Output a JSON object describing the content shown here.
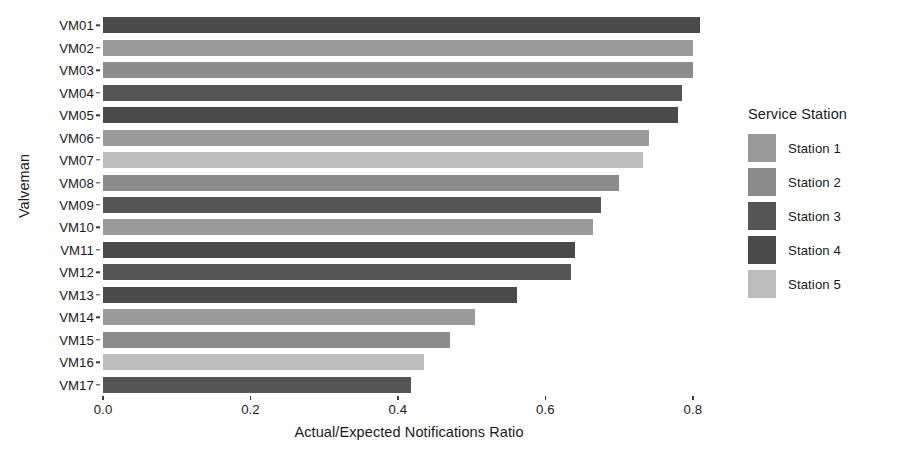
{
  "chart_data": {
    "type": "bar",
    "orientation": "horizontal",
    "title": "",
    "xlabel": "Actual/Expected Notifications Ratio",
    "ylabel": "Valveman",
    "xlim": [
      0.0,
      0.83
    ],
    "xticks": [
      0.0,
      0.2,
      0.4,
      0.6,
      0.8
    ],
    "xtick_labels": [
      "0.0",
      "0.2",
      "0.4",
      "0.6",
      "0.8"
    ],
    "grid": false,
    "legend_position": "right",
    "categories": [
      "VM01",
      "VM02",
      "VM03",
      "VM04",
      "VM05",
      "VM06",
      "VM07",
      "VM08",
      "VM09",
      "VM10",
      "VM11",
      "VM12",
      "VM13",
      "VM14",
      "VM15",
      "VM16",
      "VM17"
    ],
    "values": [
      0.81,
      0.8,
      0.8,
      0.785,
      0.78,
      0.74,
      0.733,
      0.7,
      0.675,
      0.665,
      0.64,
      0.635,
      0.562,
      0.505,
      0.47,
      0.435,
      0.418
    ],
    "group_of_bar": [
      "Station 4",
      "Station 1",
      "Station 2",
      "Station 3",
      "Station 4",
      "Station 1",
      "Station 5",
      "Station 2",
      "Station 3",
      "Station 1",
      "Station 4",
      "Station 3",
      "Station 4",
      "Station 1",
      "Station 2",
      "Station 5",
      "Station 3"
    ],
    "bars": [
      {
        "category": "VM01",
        "value": 0.81,
        "station": "Station 4",
        "color": "#4a4a4a"
      },
      {
        "category": "VM02",
        "value": 0.8,
        "station": "Station 1",
        "color": "#9a9a9a"
      },
      {
        "category": "VM03",
        "value": 0.8,
        "station": "Station 2",
        "color": "#8c8c8c"
      },
      {
        "category": "VM04",
        "value": 0.785,
        "station": "Station 3",
        "color": "#555555"
      },
      {
        "category": "VM05",
        "value": 0.78,
        "station": "Station 4",
        "color": "#4a4a4a"
      },
      {
        "category": "VM06",
        "value": 0.74,
        "station": "Station 1",
        "color": "#9a9a9a"
      },
      {
        "category": "VM07",
        "value": 0.733,
        "station": "Station 5",
        "color": "#bdbdbd"
      },
      {
        "category": "VM08",
        "value": 0.7,
        "station": "Station 2",
        "color": "#8c8c8c"
      },
      {
        "category": "VM09",
        "value": 0.675,
        "station": "Station 3",
        "color": "#555555"
      },
      {
        "category": "VM10",
        "value": 0.665,
        "station": "Station 1",
        "color": "#9a9a9a"
      },
      {
        "category": "VM11",
        "value": 0.64,
        "station": "Station 4",
        "color": "#4a4a4a"
      },
      {
        "category": "VM12",
        "value": 0.635,
        "station": "Station 3",
        "color": "#555555"
      },
      {
        "category": "VM13",
        "value": 0.562,
        "station": "Station 4",
        "color": "#4a4a4a"
      },
      {
        "category": "VM14",
        "value": 0.505,
        "station": "Station 1",
        "color": "#9a9a9a"
      },
      {
        "category": "VM15",
        "value": 0.47,
        "station": "Station 2",
        "color": "#8c8c8c"
      },
      {
        "category": "VM16",
        "value": 0.435,
        "station": "Station 5",
        "color": "#bdbdbd"
      },
      {
        "category": "VM17",
        "value": 0.418,
        "station": "Station 3",
        "color": "#555555"
      }
    ],
    "legend": {
      "title": "Service Station",
      "entries": [
        {
          "label": "Station 1",
          "color": "#9a9a9a"
        },
        {
          "label": "Station 2",
          "color": "#8c8c8c"
        },
        {
          "label": "Station 3",
          "color": "#555555"
        },
        {
          "label": "Station 4",
          "color": "#4a4a4a"
        },
        {
          "label": "Station 5",
          "color": "#bdbdbd"
        }
      ]
    }
  }
}
